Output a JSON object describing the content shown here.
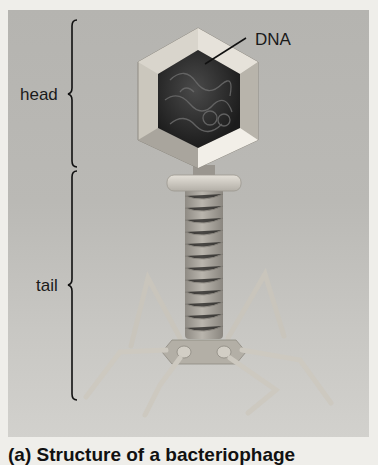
{
  "figure": {
    "labels": {
      "head": "head",
      "tail": "tail",
      "dna": "DNA"
    },
    "caption": "(a) Structure of a bacteriophage",
    "structures": [
      {
        "name": "head",
        "shape": "icosahedral capsid (hexagon cross-section)",
        "contents": "DNA"
      },
      {
        "name": "collar",
        "shape": "disc"
      },
      {
        "name": "tail-sheath",
        "shape": "helical tube"
      },
      {
        "name": "baseplate",
        "shape": "hexagonal plate"
      },
      {
        "name": "tail-fibers",
        "count_visible": 6
      }
    ],
    "colors": {
      "page_background": "#efeeea",
      "panel": "#bab9b5",
      "capsid": "#cfcac0",
      "dna_core": "#2a2a2a",
      "tail": "#a8a49c",
      "text": "#1a1a1a"
    }
  }
}
